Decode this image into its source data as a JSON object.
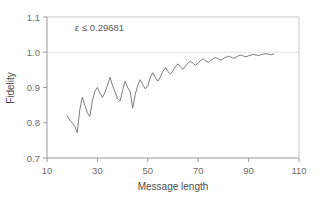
{
  "chart_data": {
    "type": "line",
    "title": "",
    "subtitle": "",
    "xlabel": "Message length",
    "ylabel": "Fidelity",
    "xlim": [
      10,
      110
    ],
    "ylim": [
      0.7,
      1.1
    ],
    "xticks": [
      10,
      30,
      50,
      70,
      90,
      110
    ],
    "xtick_labels": [
      "10",
      "30",
      "50",
      "70",
      "90",
      "110"
    ],
    "yticks": [
      0.7,
      0.8,
      0.9,
      1.0,
      1.1
    ],
    "ytick_labels": [
      "0.7",
      "0.8",
      "0.9",
      "1.0",
      "1.1"
    ],
    "grid": "horizontal-gridline-at-1.0 only",
    "legend": "none",
    "legend_position": "none",
    "line_color": "#6e6e6e",
    "frame_color": "#9a9a9a",
    "annotations": [
      {
        "name": "epsilon-bound",
        "text_symbol": "ε",
        "text_relation": "≤",
        "text_value": "0.29681",
        "full_text": "ε ≤ 0.29681",
        "x": 21,
        "y": 1.06
      }
    ],
    "series": [
      {
        "name": "fidelity",
        "x": [
          18,
          19,
          20,
          21,
          22,
          23,
          24,
          25,
          26,
          27,
          28,
          29,
          30,
          31,
          32,
          33,
          34,
          35,
          36,
          37,
          38,
          39,
          40,
          41,
          42,
          43,
          44,
          45,
          46,
          47,
          48,
          49,
          50,
          51,
          52,
          53,
          54,
          55,
          56,
          57,
          58,
          59,
          60,
          61,
          62,
          63,
          64,
          65,
          66,
          67,
          68,
          69,
          70,
          71,
          72,
          73,
          74,
          75,
          76,
          77,
          78,
          79,
          80,
          81,
          82,
          83,
          84,
          85,
          86,
          87,
          88,
          89,
          90,
          91,
          92,
          93,
          94,
          95,
          96,
          97,
          98,
          99,
          100
        ],
        "values": [
          0.82,
          0.808,
          0.8,
          0.79,
          0.772,
          0.836,
          0.872,
          0.85,
          0.828,
          0.818,
          0.862,
          0.89,
          0.9,
          0.884,
          0.872,
          0.886,
          0.906,
          0.929,
          0.906,
          0.888,
          0.868,
          0.861,
          0.892,
          0.918,
          0.9,
          0.888,
          0.841,
          0.88,
          0.906,
          0.922,
          0.908,
          0.896,
          0.905,
          0.929,
          0.942,
          0.928,
          0.918,
          0.93,
          0.946,
          0.956,
          0.945,
          0.938,
          0.948,
          0.96,
          0.967,
          0.958,
          0.952,
          0.961,
          0.97,
          0.975,
          0.968,
          0.963,
          0.97,
          0.977,
          0.981,
          0.975,
          0.971,
          0.977,
          0.982,
          0.985,
          0.981,
          0.978,
          0.982,
          0.986,
          0.989,
          0.986,
          0.983,
          0.986,
          0.99,
          0.992,
          0.989,
          0.987,
          0.99,
          0.992,
          0.994,
          0.992,
          0.991,
          0.993,
          0.995,
          0.996,
          0.994,
          0.993,
          0.995
        ]
      }
    ]
  },
  "figure": {
    "background_color": "#ffffff"
  }
}
